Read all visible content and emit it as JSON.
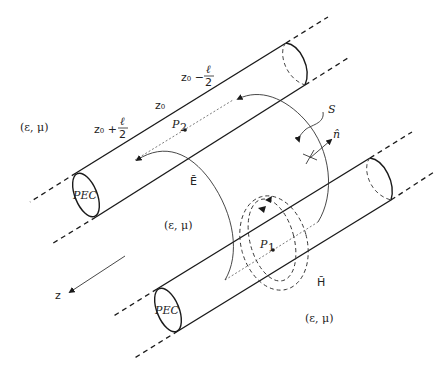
{
  "diagram": {
    "labels": {
      "medium_top_left": "(ε, μ)",
      "medium_center": "(ε, μ)",
      "medium_bottom_right": "(ε, μ)",
      "z0_minus": "z₀ −",
      "z0_plus": "z₀ +",
      "z0": "z₀",
      "ell": "ℓ",
      "two": "2",
      "P2": "P",
      "P2_sub": "2",
      "P1": "P",
      "P1_sub": "1",
      "surface": "S",
      "normal": "n̂",
      "E_field": "Ē",
      "H_field": "H̄",
      "z_axis": "z",
      "pec_top": "PEC",
      "pec_bottom": "PEC"
    },
    "components": [
      {
        "id": "conductor-top",
        "type": "cylinder",
        "label": "PEC"
      },
      {
        "id": "conductor-bottom",
        "type": "cylinder",
        "label": "PEC"
      },
      {
        "id": "e-field-arc",
        "type": "curved-arrow",
        "label": "Ē"
      },
      {
        "id": "h-field-loops",
        "type": "dashed-loops",
        "label": "H̄"
      },
      {
        "id": "surface-s",
        "type": "curved-arrow",
        "label": "S"
      },
      {
        "id": "z-axis",
        "type": "arrow",
        "label": "z"
      }
    ]
  }
}
